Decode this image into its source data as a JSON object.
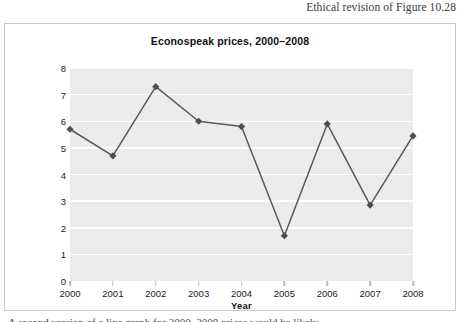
{
  "page": {
    "header_caption": "Ethical revision of Figure 10.28",
    "bottom_caption": "A second version of a line graph for 2000–2008 prices would be likely"
  },
  "chart_data": {
    "type": "line",
    "title": "Econospeak prices, 2000–2008",
    "xlabel": "Year",
    "ylabel": "Price per Share ($)",
    "categories": [
      "2000",
      "2001",
      "2002",
      "2003",
      "2004",
      "2005",
      "2006",
      "2007",
      "2008"
    ],
    "values": [
      5.7,
      4.7,
      7.3,
      6.0,
      5.8,
      1.7,
      5.9,
      2.85,
      5.45
    ],
    "ylim": [
      0,
      8
    ],
    "yticks": [
      "0",
      "1",
      "2",
      "3",
      "4",
      "5",
      "6",
      "7",
      "8"
    ],
    "grid": true,
    "legend": "none",
    "colors": {
      "line": "#595959",
      "marker": "#4d4d4d",
      "plot_background": "#ebebeb",
      "gridline": "#ffffff",
      "frame_border": "#c7c9cb",
      "text": "#111111"
    }
  }
}
